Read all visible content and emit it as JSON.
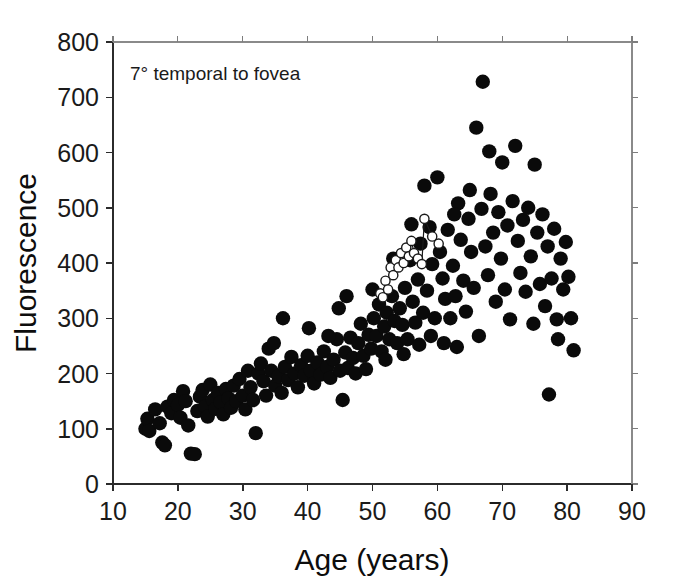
{
  "chart_data": {
    "type": "scatter",
    "title": "",
    "annotation": "7° temporal to fovea",
    "xlabel": "Age (years)",
    "ylabel": "Fluorescence",
    "xlim": [
      10,
      90
    ],
    "ylim": [
      0,
      800
    ],
    "xticks": [
      10,
      20,
      30,
      40,
      50,
      60,
      70,
      80,
      90
    ],
    "xticklabels": [
      "10",
      "20",
      "30",
      "40",
      "50",
      "60",
      "70",
      "80",
      "90"
    ],
    "yticks": [
      0,
      100,
      200,
      300,
      400,
      500,
      600,
      700,
      800
    ],
    "yticklabels": [
      "0",
      "100",
      "200",
      "300",
      "400",
      "500",
      "600",
      "700",
      "800"
    ],
    "grid": false,
    "legend": "none",
    "series": [
      {
        "name": "population",
        "marker": "filled-circle",
        "color": "#0a0a0a",
        "points": [
          [
            15.0,
            100
          ],
          [
            15.3,
            118
          ],
          [
            15.6,
            96
          ],
          [
            16.5,
            135
          ],
          [
            17.2,
            110
          ],
          [
            17.6,
            75
          ],
          [
            18.0,
            70
          ],
          [
            18.4,
            140
          ],
          [
            19.0,
            128
          ],
          [
            19.4,
            152
          ],
          [
            20.0,
            143
          ],
          [
            20.4,
            120
          ],
          [
            20.8,
            168
          ],
          [
            21.2,
            150
          ],
          [
            21.6,
            106
          ],
          [
            22.0,
            55
          ],
          [
            22.6,
            54
          ],
          [
            23.0,
            132
          ],
          [
            23.4,
            158
          ],
          [
            23.8,
            170
          ],
          [
            24.2,
            140
          ],
          [
            24.6,
            122
          ],
          [
            25.0,
            180
          ],
          [
            25.4,
            152
          ],
          [
            25.8,
            136
          ],
          [
            26.2,
            165
          ],
          [
            26.6,
            148
          ],
          [
            27.0,
            126
          ],
          [
            27.4,
            172
          ],
          [
            27.8,
            155
          ],
          [
            28.2,
            138
          ],
          [
            28.6,
            178
          ],
          [
            29.0,
            150
          ],
          [
            29.5,
            190
          ],
          [
            30.0,
            160
          ],
          [
            30.4,
            135
          ],
          [
            30.8,
            205
          ],
          [
            31.2,
            175
          ],
          [
            31.6,
            152
          ],
          [
            32.0,
            92
          ],
          [
            32.4,
            200
          ],
          [
            32.8,
            218
          ],
          [
            33.2,
            186
          ],
          [
            33.6,
            160
          ],
          [
            34.0,
            245
          ],
          [
            34.4,
            205
          ],
          [
            35.0,
            178
          ],
          [
            35.5,
            195
          ],
          [
            36.0,
            165
          ],
          [
            36.5,
            212
          ],
          [
            37.0,
            188
          ],
          [
            37.5,
            230
          ],
          [
            38.0,
            200
          ],
          [
            38.5,
            175
          ],
          [
            39.0,
            215
          ],
          [
            39.5,
            196
          ],
          [
            40.0,
            232
          ],
          [
            40.5,
            205
          ],
          [
            41.0,
            182
          ],
          [
            41.5,
            220
          ],
          [
            42.0,
            198
          ],
          [
            42.5,
            240
          ],
          [
            43.0,
            212
          ],
          [
            43.5,
            192
          ],
          [
            44.0,
            225
          ],
          [
            44.5,
            262
          ],
          [
            45.0,
            205
          ],
          [
            45.4,
            152
          ],
          [
            45.8,
            238
          ],
          [
            46.2,
            210
          ],
          [
            46.6,
            265
          ],
          [
            47.0,
            228
          ],
          [
            47.4,
            200
          ],
          [
            47.8,
            255
          ],
          [
            48.2,
            290
          ],
          [
            48.6,
            232
          ],
          [
            49.0,
            208
          ],
          [
            49.4,
            270
          ],
          [
            49.8,
            245
          ],
          [
            50.2,
            300
          ],
          [
            50.6,
            268
          ],
          [
            51.0,
            325
          ],
          [
            51.4,
            240
          ],
          [
            51.8,
            285
          ],
          [
            52.2,
            310
          ],
          [
            52.6,
            262
          ],
          [
            53.0,
            340
          ],
          [
            53.4,
            295
          ],
          [
            53.8,
            255
          ],
          [
            54.2,
            318
          ],
          [
            54.6,
            288
          ],
          [
            55.0,
            355
          ],
          [
            55.4,
            262
          ],
          [
            55.8,
            405
          ],
          [
            56.2,
            330
          ],
          [
            56.6,
            292
          ],
          [
            57.0,
            370
          ],
          [
            57.4,
            435
          ],
          [
            57.8,
            310
          ],
          [
            58.0,
            540
          ],
          [
            58.4,
            350
          ],
          [
            58.8,
            465
          ],
          [
            59.2,
            398
          ],
          [
            59.6,
            300
          ],
          [
            60.0,
            555
          ],
          [
            60.4,
            420
          ],
          [
            60.8,
            372
          ],
          [
            61.2,
            335
          ],
          [
            61.6,
            460
          ],
          [
            62.0,
            300
          ],
          [
            62.4,
            395
          ],
          [
            62.8,
            340
          ],
          [
            63.2,
            508
          ],
          [
            63.6,
            442
          ],
          [
            64.0,
            368
          ],
          [
            64.4,
            312
          ],
          [
            64.8,
            480
          ],
          [
            65.2,
            420
          ],
          [
            65.6,
            355
          ],
          [
            66.0,
            645
          ],
          [
            66.4,
            268
          ],
          [
            66.8,
            498
          ],
          [
            67.0,
            728
          ],
          [
            67.4,
            430
          ],
          [
            67.8,
            378
          ],
          [
            68.2,
            525
          ],
          [
            68.6,
            455
          ],
          [
            69.0,
            330
          ],
          [
            69.4,
            492
          ],
          [
            69.8,
            408
          ],
          [
            70.0,
            582
          ],
          [
            70.4,
            352
          ],
          [
            70.8,
            468
          ],
          [
            71.2,
            298
          ],
          [
            71.6,
            512
          ],
          [
            72.0,
            612
          ],
          [
            72.4,
            440
          ],
          [
            72.8,
            382
          ],
          [
            73.2,
            478
          ],
          [
            73.6,
            348
          ],
          [
            74.0,
            500
          ],
          [
            74.4,
            412
          ],
          [
            74.8,
            290
          ],
          [
            75.0,
            578
          ],
          [
            75.4,
            455
          ],
          [
            75.8,
            362
          ],
          [
            76.2,
            488
          ],
          [
            76.6,
            322
          ],
          [
            77.0,
            430
          ],
          [
            77.2,
            162
          ],
          [
            77.6,
            372
          ],
          [
            78.0,
            462
          ],
          [
            78.4,
            298
          ],
          [
            78.6,
            262
          ],
          [
            79.0,
            408
          ],
          [
            79.4,
            352
          ],
          [
            79.8,
            438
          ],
          [
            80.2,
            375
          ],
          [
            80.6,
            300
          ],
          [
            81.0,
            242
          ],
          [
            44.8,
            318
          ],
          [
            46.0,
            340
          ],
          [
            50.0,
            352
          ],
          [
            53.2,
            408
          ],
          [
            56.0,
            470
          ],
          [
            62.6,
            488
          ],
          [
            65.0,
            532
          ],
          [
            68.0,
            602
          ],
          [
            61.0,
            255
          ],
          [
            63.0,
            248
          ],
          [
            59.0,
            268
          ],
          [
            57.2,
            252
          ],
          [
            54.8,
            235
          ],
          [
            52.0,
            225
          ],
          [
            36.2,
            300
          ],
          [
            40.2,
            282
          ],
          [
            43.2,
            268
          ],
          [
            34.8,
            255
          ]
        ]
      },
      {
        "name": "longitudinal-subject",
        "marker": "open-circle",
        "connected": true,
        "color": "#1a1a1a",
        "points": [
          [
            51.2,
            345
          ],
          [
            51.6,
            338
          ],
          [
            52.0,
            368
          ],
          [
            52.4,
            352
          ],
          [
            52.8,
            392
          ],
          [
            53.2,
            378
          ],
          [
            53.6,
            405
          ],
          [
            54.0,
            392
          ],
          [
            54.4,
            418
          ],
          [
            54.8,
            400
          ],
          [
            55.2,
            428
          ],
          [
            55.6,
            412
          ],
          [
            56.0,
            440
          ],
          [
            56.4,
            418
          ],
          [
            57.0,
            408
          ],
          [
            57.6,
            398
          ],
          [
            58.0,
            480
          ],
          [
            59.2,
            448
          ],
          [
            60.2,
            435
          ]
        ]
      }
    ]
  },
  "axis_geometry": {
    "plot_left": 113,
    "plot_right": 632,
    "plot_top": 42,
    "plot_bottom": 484
  }
}
